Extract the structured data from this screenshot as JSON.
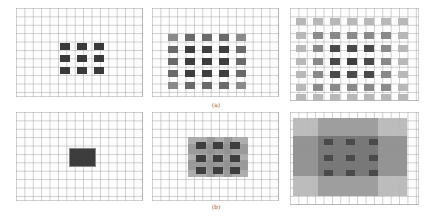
{
  "figure": {
    "row_a": {
      "label": "(a)",
      "panels": [
        {
          "name": "dilation-1",
          "kernel_grid": "3x3",
          "shades": [
            [
              "#3a3a3a",
              "#3a3a3a",
              "#3a3a3a"
            ],
            [
              "#3a3a3a",
              "#3a3a3a",
              "#3a3a3a"
            ],
            [
              "#3a3a3a",
              "#3a3a3a",
              "#3a3a3a"
            ]
          ]
        },
        {
          "name": "dilation-2",
          "kernel_grid": "5x5"
        },
        {
          "name": "dilation-3",
          "kernel_grid": "7x7"
        }
      ]
    },
    "row_b": {
      "label": "(b)",
      "panels": [
        {
          "name": "layer-1",
          "receptive_field": "single dark block"
        },
        {
          "name": "layer-2",
          "receptive_field": "3x3 dark blocks over medium overlay"
        },
        {
          "name": "layer-3",
          "receptive_field": "3x3 dark blocks over layered overlays"
        }
      ]
    },
    "colors": {
      "grid_line": "#a0a0a0",
      "dark": "#3a3a3a",
      "medium": "#7a7a7a",
      "light": "#b5b5b5",
      "background": "#ffffff"
    }
  }
}
